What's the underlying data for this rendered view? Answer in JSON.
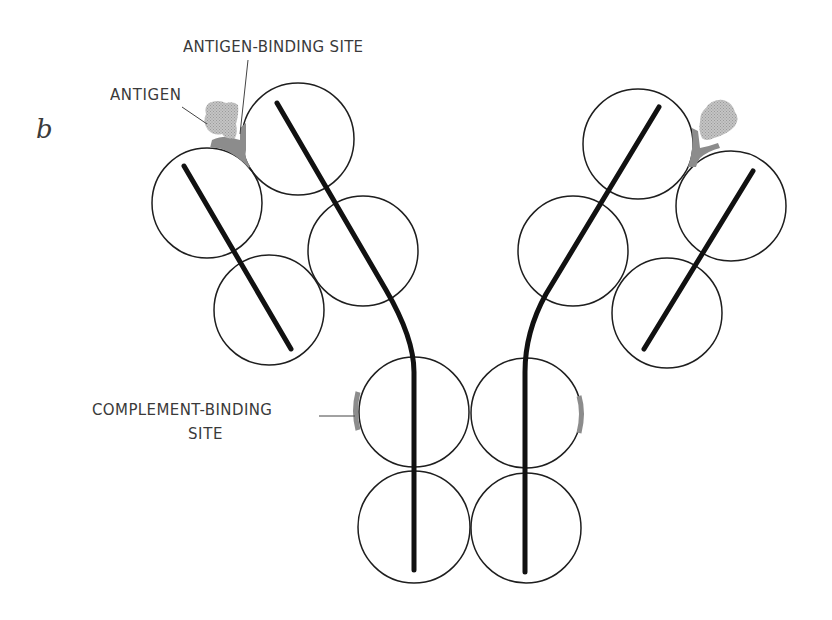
{
  "figure": {
    "panel_letter": "b",
    "labels": {
      "antigen": "ANTIGEN",
      "antigen_binding_site": "ANTIGEN-BINDING SITE",
      "complement_binding_site_line1": "COMPLEMENT-BINDING",
      "complement_binding_site_line2": "SITE"
    },
    "colors": {
      "outline": "#1e1e1e",
      "chain": "#111111",
      "binding_site": "#8c8c8c",
      "antigen": "#b4b4b4",
      "text": "#3a3a3a",
      "background": "#ffffff"
    },
    "structure": {
      "description": "Y-shaped antibody molecule; domains drawn as circles, polypeptide chains as thick lines",
      "left_arm_domains": 4,
      "right_arm_domains": 4,
      "stem_domains": 4,
      "antigens_bound": 2,
      "complement_binding_sites": 2
    }
  }
}
